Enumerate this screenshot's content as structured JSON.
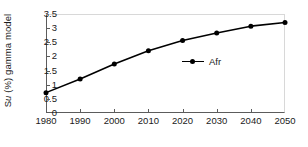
{
  "chart_data": {
    "type": "line",
    "title": "",
    "xlabel": "",
    "ylabel": "Su (%) gamma model",
    "ylabel_prefix": "S",
    "ylabel_italic": "u",
    "ylabel_suffix": " (%) gamma model",
    "x": [
      1980,
      1990,
      2000,
      2010,
      2020,
      2030,
      2040,
      2050
    ],
    "xticklabels": [
      "1980",
      "1990",
      "2000",
      "2010",
      "2020",
      "2030",
      "2040",
      "2050"
    ],
    "yticklabels": [
      "0",
      "0.5",
      "1",
      "1.5",
      "2",
      "2.5",
      "3",
      "3.5"
    ],
    "yticks": [
      0,
      0.5,
      1,
      1.5,
      2,
      2.5,
      3,
      3.5
    ],
    "xlim": [
      1980,
      2050
    ],
    "ylim": [
      0,
      3.5
    ],
    "grid": false,
    "legend_position": "center",
    "series": [
      {
        "name": "Afr",
        "values": [
          0.72,
          1.2,
          1.73,
          2.2,
          2.56,
          2.83,
          3.07,
          3.2
        ],
        "color": "#000000",
        "marker": "circle",
        "line_width": 1.6,
        "marker_size": 5
      }
    ],
    "legend": [
      {
        "label": "Afr",
        "marker": "line-circle-marker",
        "color": "#000000"
      }
    ]
  },
  "colors": {
    "axis": "#5c5c5c",
    "frame_light": "#d8d8d8",
    "series": "#000000",
    "text": "#1a1a1a",
    "background": "#ffffff"
  }
}
